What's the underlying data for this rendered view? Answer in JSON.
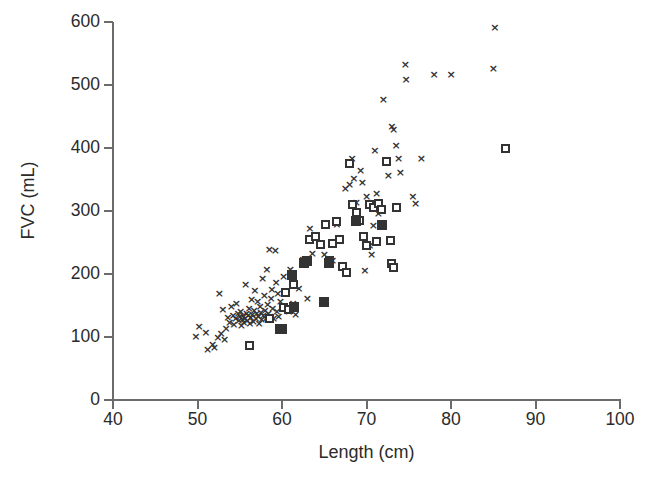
{
  "chart_data": {
    "type": "scatter",
    "title": "",
    "xlabel": "Length (cm)",
    "ylabel": "FVC (mL)",
    "xlim": [
      40,
      100
    ],
    "ylim": [
      0,
      600
    ],
    "xticks": [
      40,
      50,
      60,
      70,
      80,
      90,
      100
    ],
    "yticks": [
      0,
      100,
      200,
      300,
      400,
      500,
      600
    ],
    "grid": false,
    "legend": "none",
    "series": [
      {
        "name": "x-marker-series",
        "marker": "x",
        "color": "#333333",
        "points": [
          [
            49.8,
            100
          ],
          [
            50.2,
            116
          ],
          [
            51.0,
            107
          ],
          [
            51.2,
            80
          ],
          [
            51.8,
            88
          ],
          [
            52.0,
            82
          ],
          [
            52.4,
            98
          ],
          [
            52.6,
            168
          ],
          [
            52.8,
            104
          ],
          [
            53.0,
            143
          ],
          [
            53.2,
            96
          ],
          [
            53.4,
            112
          ],
          [
            53.6,
            130
          ],
          [
            53.8,
            122
          ],
          [
            54.0,
            147
          ],
          [
            54.2,
            133
          ],
          [
            54.3,
            119
          ],
          [
            54.5,
            128
          ],
          [
            54.6,
            152
          ],
          [
            54.8,
            136
          ],
          [
            54.9,
            125
          ],
          [
            55.0,
            131
          ],
          [
            55.1,
            140
          ],
          [
            55.2,
            118
          ],
          [
            55.3,
            127
          ],
          [
            55.4,
            134
          ],
          [
            55.5,
            122
          ],
          [
            55.6,
            129
          ],
          [
            55.7,
            182
          ],
          [
            55.8,
            137
          ],
          [
            55.9,
            126
          ],
          [
            56.0,
            133
          ],
          [
            56.1,
            145
          ],
          [
            56.2,
            120
          ],
          [
            56.3,
            130
          ],
          [
            56.4,
            158
          ],
          [
            56.5,
            135
          ],
          [
            56.6,
            124
          ],
          [
            56.7,
            141
          ],
          [
            56.8,
            173
          ],
          [
            56.9,
            128
          ],
          [
            57.0,
            136
          ],
          [
            57.1,
            155
          ],
          [
            57.2,
            131
          ],
          [
            57.3,
            121
          ],
          [
            57.4,
            148
          ],
          [
            57.5,
            138
          ],
          [
            57.6,
            127
          ],
          [
            57.7,
            192
          ],
          [
            57.8,
            133
          ],
          [
            57.9,
            165
          ],
          [
            58.0,
            142
          ],
          [
            58.1,
            129
          ],
          [
            58.2,
            206
          ],
          [
            58.3,
            151
          ],
          [
            58.4,
            137
          ],
          [
            58.5,
            238
          ],
          [
            58.6,
            132
          ],
          [
            58.7,
            160
          ],
          [
            58.8,
            175
          ],
          [
            58.9,
            145
          ],
          [
            59.0,
            128
          ],
          [
            59.2,
            237
          ],
          [
            59.3,
            185
          ],
          [
            59.4,
            140
          ],
          [
            59.5,
            168
          ],
          [
            59.6,
            131
          ],
          [
            59.8,
            155
          ],
          [
            60.0,
            144
          ],
          [
            60.2,
            196
          ],
          [
            60.5,
            172
          ],
          [
            60.8,
            140
          ],
          [
            61.0,
            207
          ],
          [
            61.3,
            152
          ],
          [
            61.6,
            135
          ],
          [
            62.0,
            176
          ],
          [
            62.5,
            222
          ],
          [
            63.0,
            160
          ],
          [
            63.3,
            272
          ],
          [
            63.6,
            231
          ],
          [
            64.5,
            245
          ],
          [
            65.0,
            230
          ],
          [
            65.5,
            218
          ],
          [
            66.0,
            221
          ],
          [
            66.5,
            277
          ],
          [
            67.5,
            335
          ],
          [
            68.0,
            341
          ],
          [
            68.3,
            383
          ],
          [
            68.5,
            351
          ],
          [
            68.8,
            312
          ],
          [
            69.0,
            285
          ],
          [
            69.3,
            364
          ],
          [
            69.5,
            345
          ],
          [
            69.8,
            205
          ],
          [
            70.0,
            322
          ],
          [
            70.2,
            313
          ],
          [
            70.4,
            245
          ],
          [
            70.6,
            230
          ],
          [
            70.8,
            276
          ],
          [
            71.0,
            396
          ],
          [
            71.2,
            327
          ],
          [
            71.4,
            296
          ],
          [
            72.0,
            476
          ],
          [
            72.6,
            355
          ],
          [
            73.0,
            434
          ],
          [
            73.2,
            428
          ],
          [
            73.5,
            403
          ],
          [
            73.8,
            383
          ],
          [
            74.0,
            360
          ],
          [
            74.6,
            531
          ],
          [
            74.7,
            508
          ],
          [
            75.5,
            322
          ],
          [
            75.8,
            311
          ],
          [
            76.5,
            383
          ],
          [
            78.0,
            516
          ],
          [
            80.0,
            516
          ],
          [
            85.0,
            525
          ],
          [
            85.2,
            590
          ]
        ]
      },
      {
        "name": "open-square-series",
        "marker": "open-square",
        "color": "#333333",
        "points": [
          [
            56.2,
            86
          ],
          [
            58.5,
            130
          ],
          [
            60.2,
            147
          ],
          [
            60.4,
            170
          ],
          [
            60.8,
            143
          ],
          [
            61.4,
            184
          ],
          [
            63.3,
            255
          ],
          [
            64.0,
            259
          ],
          [
            64.6,
            247
          ],
          [
            65.2,
            278
          ],
          [
            65.6,
            222
          ],
          [
            66.0,
            248
          ],
          [
            66.4,
            284
          ],
          [
            66.8,
            255
          ],
          [
            67.2,
            212
          ],
          [
            67.6,
            203
          ],
          [
            68.0,
            375
          ],
          [
            68.4,
            310
          ],
          [
            68.8,
            298
          ],
          [
            69.2,
            285
          ],
          [
            69.6,
            260
          ],
          [
            70.0,
            246
          ],
          [
            70.4,
            311
          ],
          [
            70.8,
            305
          ],
          [
            71.2,
            251
          ],
          [
            71.4,
            312
          ],
          [
            71.8,
            303
          ],
          [
            72.4,
            378
          ],
          [
            72.8,
            253
          ],
          [
            73.0,
            217
          ],
          [
            73.2,
            210
          ],
          [
            73.6,
            305
          ],
          [
            86.5,
            400
          ]
        ]
      },
      {
        "name": "filled-square-series",
        "marker": "filled-square",
        "color": "#333333",
        "points": [
          [
            59.8,
            112
          ],
          [
            60.0,
            113
          ],
          [
            61.2,
            198
          ],
          [
            61.4,
            148
          ],
          [
            62.6,
            218
          ],
          [
            63.0,
            220
          ],
          [
            65.0,
            155
          ],
          [
            65.6,
            218
          ],
          [
            68.8,
            284
          ],
          [
            71.8,
            277
          ]
        ]
      }
    ]
  },
  "axes": {
    "x": {
      "label": "Length (cm)",
      "tick_labels": [
        "40",
        "50",
        "60",
        "70",
        "80",
        "90",
        "100"
      ]
    },
    "y": {
      "label": "FVC (mL)",
      "tick_labels": [
        "0",
        "100",
        "200",
        "300",
        "400",
        "500",
        "600"
      ]
    }
  },
  "style": {
    "axis_color": "#6b6b6b",
    "marker_color": "#333333",
    "text_color": "#2b2b2b",
    "background": "#ffffff"
  }
}
